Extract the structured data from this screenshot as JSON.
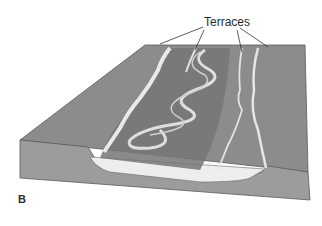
{
  "figure": {
    "panel_label": "B",
    "annotation": "Terraces",
    "annotation_leader_count": 4,
    "colors": {
      "surface": "#8c8c8c",
      "front_face": "#9a9a9a",
      "floodplain_dark": "#6e6e6e",
      "terrace_highlight": "#e8e8e8",
      "sediment_fill": "#eeeeee",
      "river_channel": "#d9d9d9",
      "outline": "#555555"
    }
  }
}
